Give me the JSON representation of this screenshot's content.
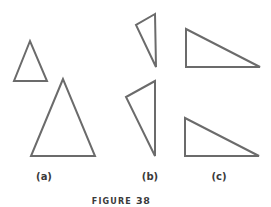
{
  "figure": {
    "caption_word": "FIGURE",
    "caption_number": "38",
    "stroke_color": "#6b6b6b",
    "groups": [
      {
        "label": "(a)",
        "shapes": [
          {
            "name": "small-isosceles-triangle",
            "points": "30,41 14,81 47,81"
          },
          {
            "name": "large-isosceles-triangle",
            "points": "63,79 31,156 95,156"
          }
        ]
      },
      {
        "label": "(b)",
        "shapes": [
          {
            "name": "small-scalene-triangle",
            "points": "155,14 136,25 156,67"
          },
          {
            "name": "large-scalene-triangle",
            "points": "155,81 126,97 155,156"
          }
        ]
      },
      {
        "label": "(c)",
        "shapes": [
          {
            "name": "right-triangle-top",
            "points": "186,29 186,67 260,67"
          },
          {
            "name": "right-triangle-bottom",
            "points": "185,118 185,156 259,156"
          }
        ]
      }
    ]
  }
}
